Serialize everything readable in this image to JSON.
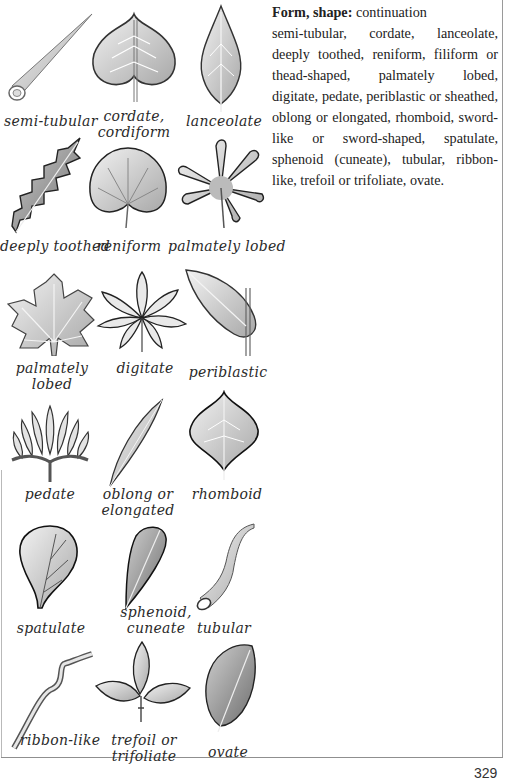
{
  "text": {
    "heading": "Form, shape:",
    "subheading": "continuation",
    "body": "semi-tubular, cordate, lanceolate, deeply toothed, reniform, filiform or thead-shaped, palmately lobed, digitate, pedate, periblastic or sheathed,  oblong or elongated, rhomboid, sword-like or sword-shaped, spatulate, sphenoid (cuneate), tubular, ribbon-like, trefoil or trifoliate, ovate."
  },
  "illustrations": [
    {
      "caption": "semi-tubular",
      "icon": "semi-tubular-leaf-icon"
    },
    {
      "caption": "cordate,\ncordiform",
      "icon": "cordate-leaf-icon"
    },
    {
      "caption": "lanceolate",
      "icon": "lanceolate-leaf-icon"
    },
    {
      "caption": "deeply toothed",
      "icon": "deeply-toothed-leaf-icon"
    },
    {
      "caption": "reniform",
      "icon": "reniform-leaf-icon"
    },
    {
      "caption": "palmately lobed",
      "icon": "palmately-lobed-leaf-icon"
    },
    {
      "caption": "palmately\nlobed",
      "icon": "palmately-lobed-maple-leaf-icon"
    },
    {
      "caption": "digitate",
      "icon": "digitate-leaf-icon"
    },
    {
      "caption": "periblastic",
      "icon": "periblastic-leaf-icon"
    },
    {
      "caption": "pedate",
      "icon": "pedate-leaf-icon"
    },
    {
      "caption": "oblong or\nelongated",
      "icon": "oblong-leaf-icon"
    },
    {
      "caption": "rhomboid",
      "icon": "rhomboid-leaf-icon"
    },
    {
      "caption": "spatulate",
      "icon": "spatulate-leaf-icon"
    },
    {
      "caption": "sphenoid,\ncuneate",
      "icon": "sphenoid-leaf-icon"
    },
    {
      "caption": "tubular",
      "icon": "tubular-leaf-icon"
    },
    {
      "caption": "ribbon-like",
      "icon": "ribbon-like-leaf-icon"
    },
    {
      "caption": "trefoil or\ntrifoliate",
      "icon": "trefoil-leaf-icon"
    },
    {
      "caption": "ovate",
      "icon": "ovate-leaf-icon"
    }
  ],
  "page_number": "329",
  "colors": {
    "ink": "#2a2a2a",
    "leaf_fill": "#d4d4d4",
    "frame": "#9a9a9a"
  }
}
